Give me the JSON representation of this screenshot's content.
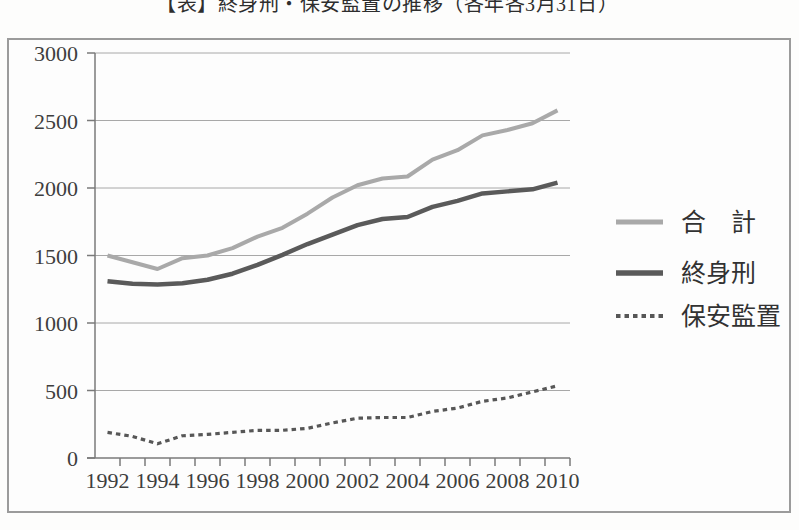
{
  "title": {
    "text": "【表】終身刑・保安監置の推移（各年各3月31日）"
  },
  "chart_data": {
    "type": "line",
    "x": [
      1992,
      1993,
      1994,
      1995,
      1996,
      1997,
      1998,
      1999,
      2000,
      2001,
      2002,
      2003,
      2004,
      2005,
      2006,
      2007,
      2008,
      2009,
      2010
    ],
    "x_axis_tick_labels": [
      "1992",
      "1994",
      "1996",
      "1998",
      "2000",
      "2002",
      "2004",
      "2006",
      "2008",
      "2010"
    ],
    "y_ticks": [
      "3000",
      "2500",
      "2000",
      "1500",
      "1000",
      "500",
      "0"
    ],
    "ylim": [
      0,
      3000
    ],
    "grid": true,
    "legend_position": "right",
    "series": [
      {
        "key": "total",
        "name": "合　計",
        "style": "solid",
        "color": "#a9a9a9",
        "values": [
          1500,
          1450,
          1400,
          1480,
          1500,
          1555,
          1640,
          1705,
          1810,
          1930,
          2020,
          2070,
          2085,
          2210,
          2280,
          2390,
          2430,
          2480,
          2575
        ]
      },
      {
        "key": "life-sentence",
        "name": "終身刑",
        "style": "solid",
        "color": "#5a5a5a",
        "values": [
          1310,
          1290,
          1285,
          1295,
          1320,
          1365,
          1430,
          1505,
          1585,
          1655,
          1725,
          1770,
          1785,
          1860,
          1905,
          1960,
          1975,
          1990,
          2040
        ]
      },
      {
        "key": "preventive-detention",
        "name": "保安監置",
        "style": "dotted",
        "color": "#575757",
        "values": [
          190,
          160,
          105,
          165,
          175,
          190,
          205,
          205,
          220,
          260,
          295,
          300,
          300,
          345,
          370,
          420,
          445,
          490,
          535
        ]
      }
    ]
  }
}
